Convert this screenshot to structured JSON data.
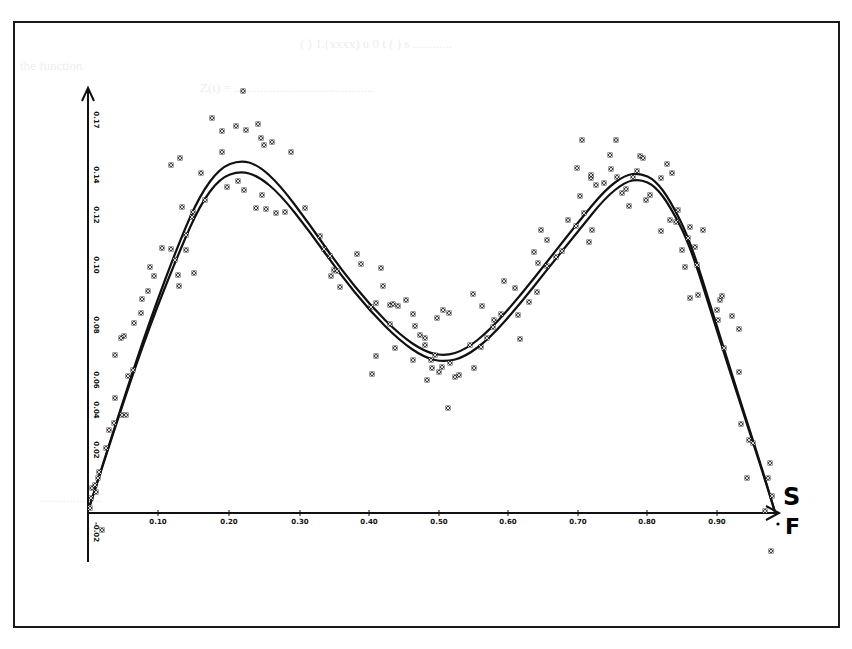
{
  "chart_data": {
    "type": "scatter",
    "title": "",
    "xlabel": "S/F",
    "xlabel_parts": [
      "S",
      "F"
    ],
    "ylabel": "",
    "x_ticks": [
      "0.10",
      "0.20",
      "0.30",
      "0.40",
      "0.50",
      "0.60",
      "0.70",
      "0.80",
      "0.90"
    ],
    "y_ticks": [
      "0.17",
      "0.14",
      "0.12",
      "0.10",
      "0.08",
      "0.06",
      "0.04",
      "0.02",
      "-0.02"
    ],
    "xlim": [
      0.0,
      0.92
    ],
    "grid": false,
    "legend": null,
    "series": [
      {
        "name": "observed points",
        "marker": "x",
        "points_px": [
          [
            243,
            91
          ],
          [
            212,
            118
          ],
          [
            222,
            131
          ],
          [
            236,
            126
          ],
          [
            246,
            130
          ],
          [
            258,
            124
          ],
          [
            261,
            138
          ],
          [
            264,
            145
          ],
          [
            272,
            142
          ],
          [
            291,
            152
          ],
          [
            222,
            152
          ],
          [
            171,
            165
          ],
          [
            180,
            158
          ],
          [
            201,
            173
          ],
          [
            227,
            187
          ],
          [
            238,
            181
          ],
          [
            205,
            200
          ],
          [
            244,
            190
          ],
          [
            262,
            195
          ],
          [
            276,
            213
          ],
          [
            182,
            207
          ],
          [
            193,
            212
          ],
          [
            192,
            217
          ],
          [
            186,
            235
          ],
          [
            186,
            250
          ],
          [
            194,
            273
          ],
          [
            256,
            208
          ],
          [
            266,
            209
          ],
          [
            285,
            212
          ],
          [
            305,
            208
          ],
          [
            162,
            248
          ],
          [
            171,
            249
          ],
          [
            175,
            260
          ],
          [
            179,
            286
          ],
          [
            150,
            267
          ],
          [
            154,
            276
          ],
          [
            178,
            275
          ],
          [
            148,
            291
          ],
          [
            142,
            299
          ],
          [
            141,
            313
          ],
          [
            134,
            323
          ],
          [
            124,
            336
          ],
          [
            121,
            338
          ],
          [
            115,
            355
          ],
          [
            133,
            370
          ],
          [
            128,
            376
          ],
          [
            115,
            398
          ],
          [
            122,
            415
          ],
          [
            126,
            415
          ],
          [
            114,
            423
          ],
          [
            109,
            430
          ],
          [
            106,
            448
          ],
          [
            99,
            472
          ],
          [
            98,
            478
          ],
          [
            92,
            488
          ],
          [
            96,
            492
          ],
          [
            95,
            485
          ],
          [
            91,
            498
          ],
          [
            90,
            508
          ],
          [
            102,
            530
          ],
          [
            320,
            236
          ],
          [
            324,
            249
          ],
          [
            330,
            256
          ],
          [
            334,
            270
          ],
          [
            337,
            271
          ],
          [
            331,
            276
          ],
          [
            340,
            287
          ],
          [
            357,
            254
          ],
          [
            361,
            264
          ],
          [
            381,
            268
          ],
          [
            383,
            286
          ],
          [
            390,
            305
          ],
          [
            393,
            304
          ],
          [
            398,
            306
          ],
          [
            406,
            300
          ],
          [
            413,
            314
          ],
          [
            415,
            326
          ],
          [
            420,
            335
          ],
          [
            425,
            338
          ],
          [
            425,
            345
          ],
          [
            435,
            355
          ],
          [
            431,
            360
          ],
          [
            442,
            367
          ],
          [
            432,
            368
          ],
          [
            439,
            372
          ],
          [
            450,
            363
          ],
          [
            455,
            377
          ],
          [
            459,
            375
          ],
          [
            448,
            408
          ],
          [
            474,
            368
          ],
          [
            371,
            307
          ],
          [
            376,
            303
          ],
          [
            390,
            324
          ],
          [
            395,
            348
          ],
          [
            376,
            356
          ],
          [
            372,
            374
          ],
          [
            413,
            360
          ],
          [
            437,
            318
          ],
          [
            449,
            313
          ],
          [
            443,
            310
          ],
          [
            427,
            380
          ],
          [
            470,
            345
          ],
          [
            481,
            347
          ],
          [
            487,
            338
          ],
          [
            494,
            320
          ],
          [
            501,
            314
          ],
          [
            518,
            315
          ],
          [
            520,
            339
          ],
          [
            515,
            288
          ],
          [
            504,
            281
          ],
          [
            482,
            306
          ],
          [
            473,
            294
          ],
          [
            493,
            327
          ],
          [
            537,
            292
          ],
          [
            529,
            302
          ],
          [
            534,
            252
          ],
          [
            547,
            240
          ],
          [
            541,
            230
          ],
          [
            538,
            263
          ],
          [
            547,
            266
          ],
          [
            556,
            257
          ],
          [
            562,
            251
          ],
          [
            568,
            220
          ],
          [
            576,
            226
          ],
          [
            589,
            242
          ],
          [
            584,
            213
          ],
          [
            577,
            168
          ],
          [
            582,
            140
          ],
          [
            580,
            196
          ],
          [
            592,
            230
          ],
          [
            591,
            178
          ],
          [
            591,
            175
          ],
          [
            596,
            185
          ],
          [
            604,
            183
          ],
          [
            610,
            155
          ],
          [
            611,
            169
          ],
          [
            616,
            140
          ],
          [
            617,
            177
          ],
          [
            622,
            193
          ],
          [
            626,
            189
          ],
          [
            633,
            177
          ],
          [
            637,
            171
          ],
          [
            640,
            156
          ],
          [
            643,
            158
          ],
          [
            650,
            195
          ],
          [
            629,
            206
          ],
          [
            646,
            200
          ],
          [
            661,
            178
          ],
          [
            667,
            164
          ],
          [
            672,
            173
          ],
          [
            670,
            220
          ],
          [
            661,
            231
          ],
          [
            678,
            210
          ],
          [
            676,
            222
          ],
          [
            682,
            250
          ],
          [
            688,
            238
          ],
          [
            703,
            230
          ],
          [
            690,
            227
          ],
          [
            695,
            247
          ],
          [
            685,
            267
          ],
          [
            697,
            265
          ],
          [
            690,
            298
          ],
          [
            698,
            295
          ],
          [
            720,
            300
          ],
          [
            722,
            296
          ],
          [
            717,
            310
          ],
          [
            718,
            320
          ],
          [
            724,
            348
          ],
          [
            732,
            316
          ],
          [
            739,
            329
          ],
          [
            739,
            372
          ],
          [
            741,
            424
          ],
          [
            749,
            440
          ],
          [
            753,
            443
          ],
          [
            747,
            478
          ],
          [
            770,
            463
          ],
          [
            768,
            478
          ],
          [
            772,
            496
          ],
          [
            765,
            511
          ],
          [
            771,
            551
          ]
        ]
      },
      {
        "name": "fitted curve A",
        "line": true,
        "path_px": [
          [
            90,
            505
          ],
          [
            120,
            410
          ],
          [
            150,
            320
          ],
          [
            180,
            240
          ],
          [
            200,
            195
          ],
          [
            220,
            168
          ],
          [
            240,
            160
          ],
          [
            258,
            165
          ],
          [
            280,
            185
          ],
          [
            310,
            225
          ],
          [
            340,
            268
          ],
          [
            370,
            305
          ],
          [
            400,
            335
          ],
          [
            425,
            352
          ],
          [
            445,
            356
          ],
          [
            465,
            350
          ],
          [
            490,
            330
          ],
          [
            520,
            296
          ],
          [
            550,
            258
          ],
          [
            580,
            220
          ],
          [
            605,
            190
          ],
          [
            625,
            175
          ],
          [
            640,
            173
          ],
          [
            655,
            180
          ],
          [
            670,
            200
          ],
          [
            690,
            240
          ],
          [
            715,
            320
          ],
          [
            740,
            400
          ],
          [
            760,
            462
          ],
          [
            775,
            512
          ]
        ]
      },
      {
        "name": "fitted curve B",
        "line": true,
        "path_px": [
          [
            90,
            505
          ],
          [
            120,
            412
          ],
          [
            150,
            325
          ],
          [
            180,
            250
          ],
          [
            200,
            205
          ],
          [
            220,
            178
          ],
          [
            240,
            171
          ],
          [
            258,
            176
          ],
          [
            280,
            194
          ],
          [
            310,
            232
          ],
          [
            340,
            274
          ],
          [
            370,
            311
          ],
          [
            400,
            341
          ],
          [
            425,
            358
          ],
          [
            445,
            362
          ],
          [
            465,
            357
          ],
          [
            490,
            338
          ],
          [
            520,
            304
          ],
          [
            550,
            266
          ],
          [
            580,
            229
          ],
          [
            605,
            198
          ],
          [
            625,
            182
          ],
          [
            640,
            179
          ],
          [
            655,
            186
          ],
          [
            670,
            206
          ],
          [
            690,
            245
          ],
          [
            715,
            325
          ],
          [
            740,
            403
          ],
          [
            760,
            464
          ],
          [
            775,
            512
          ]
        ]
      }
    ],
    "axes_px": {
      "origin": [
        88,
        513
      ],
      "y_top": 88,
      "y_bottom": 560,
      "x_right": 780,
      "x_tick_px": [
        158,
        229,
        300,
        369,
        439,
        508,
        578,
        647,
        717
      ],
      "y_tick_px": [
        120,
        175,
        215,
        265,
        325,
        380,
        410,
        450,
        532
      ]
    }
  }
}
